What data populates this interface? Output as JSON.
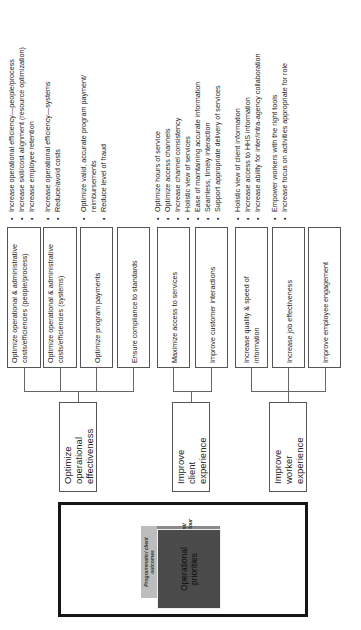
{
  "cube": {
    "front_label": "Operational priorities",
    "side_label": "Programmatic/ client outcomes",
    "top_label": "Client/ behaviour",
    "colors": {
      "front": "#4b4b4b",
      "top": "#8a8a8a",
      "side": "#bdbdbd",
      "frame": "#151515"
    }
  },
  "priorities": [
    {
      "label": "Optimize operational effectiveness",
      "objectives": [
        {
          "label": "Optimize operational & administrative costs/efficiencies (people/process)",
          "bullets": [
            "Increase operational efficiency—people/process",
            "Increase skill/cost alignment (resource optimization)",
            "Increase employee retention"
          ]
        },
        {
          "label": "Optimize operational & administrative costs/efficiencies (systems)",
          "bullets": [
            "Increase operational efficiency—systems",
            "Reduce/avoid costs"
          ]
        },
        {
          "label": "Optimize program payments",
          "bullets": [
            "Optimize valid, accurate program payment/",
            "reimbursements",
            "Reduce level of fraud"
          ]
        },
        {
          "label": "Ensure compliance to standards",
          "bullets": []
        }
      ]
    },
    {
      "label": "Improve client experience",
      "objectives": [
        {
          "label": "Maximize access to services",
          "bullets": [
            "Optimize hours of service",
            "Optimize access channels",
            "Increase channel consistency",
            "Holistic view of services"
          ]
        },
        {
          "label": "Improve customer interactions",
          "bullets": [
            "Ease of maintaining accurate information",
            "Seamless, timely interaction",
            "Support appropriate delivery of services"
          ]
        }
      ]
    },
    {
      "label": "Improve worker experience",
      "objectives": [
        {
          "label": "Increase quality & speed of information",
          "bullets": [
            "Holistic view of client information",
            "Increase access to HHS information",
            "Increase ability for inter/intra-agency collaboration"
          ]
        },
        {
          "label": "Increase job effectiveness",
          "bullets": [
            "Empower workers with the right tools",
            "Increase focus on activities appropriate for role"
          ]
        },
        {
          "label": "Improve employee engagement",
          "bullets": []
        }
      ]
    }
  ]
}
